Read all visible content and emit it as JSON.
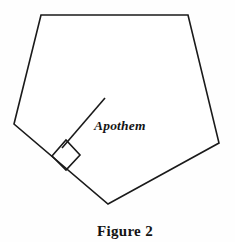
{
  "figure": {
    "caption": "Figure 2",
    "apothem_label": "Apothem",
    "background_color": "#fefefe",
    "stroke_color": "#1a1a1a",
    "stroke_width": 1.6,
    "canvas": {
      "width": 235,
      "height": 242
    }
  },
  "chart_data": {
    "type": "diagram",
    "title": "Figure 2",
    "shape": {
      "name": "pentagon",
      "closed": true,
      "vertices": [
        {
          "name": "top-left",
          "x": 41,
          "y": 15
        },
        {
          "name": "top-right",
          "x": 188,
          "y": 15
        },
        {
          "name": "right",
          "x": 219,
          "y": 143
        },
        {
          "name": "bottom",
          "x": 108,
          "y": 204
        },
        {
          "name": "left",
          "x": 14,
          "y": 124
        }
      ]
    },
    "apothem_segment": {
      "label": "Apothem",
      "from": {
        "x": 105,
        "y": 98
      },
      "to": {
        "x": 62,
        "y": 148
      }
    },
    "right_angle_marker": {
      "type": "square",
      "points": [
        {
          "x": 52,
          "y": 156
        },
        {
          "x": 66,
          "y": 140
        },
        {
          "x": 80,
          "y": 155
        },
        {
          "x": 66,
          "y": 170
        }
      ]
    },
    "annotations": [
      {
        "text": "Apothem",
        "x": 94,
        "y": 130,
        "style": "italic-serif"
      },
      {
        "text": "Figure 2",
        "x": 125,
        "y": 236,
        "style": "bold-serif",
        "anchor": "middle"
      }
    ],
    "grid": false,
    "legend": null
  }
}
